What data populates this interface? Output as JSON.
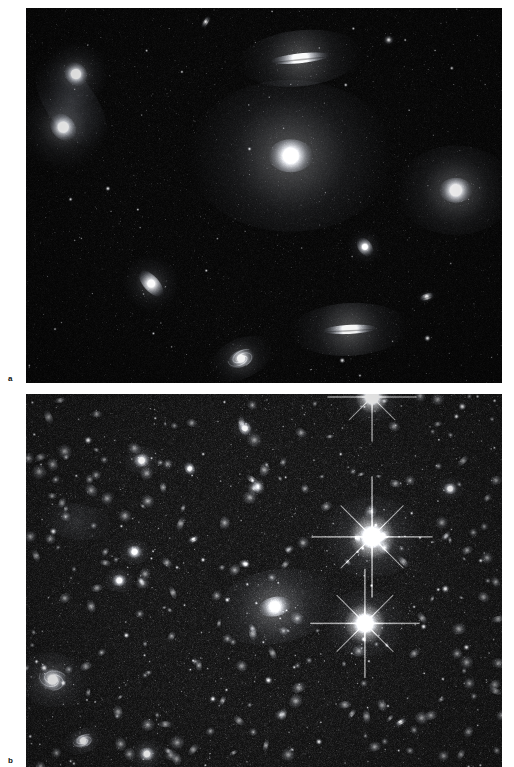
{
  "figure": {
    "background_color": "#ffffff",
    "width": 514,
    "height": 767
  },
  "panels": [
    {
      "id": "panel-a",
      "label": "a",
      "name": "sparse-galaxy-group-field",
      "description": "Wide-field optical image of a sparse galaxy group. A dominant bright elliptical galaxy sits near the centre, with several lenticular and edge-on disc galaxies and an interacting pair showing a tidal tail at upper left.",
      "background_color": "#020202",
      "sky_noise_density": 0.00055,
      "star_count": 430,
      "left": 26,
      "top": 8,
      "width": 476,
      "height": 375,
      "galaxies": [
        {
          "name": "interacting-pair-north",
          "type": "elliptical",
          "cx": 0.105,
          "cy": 0.176,
          "rx": 0.022,
          "ry": 0.034,
          "angle": -38,
          "brightness": 0.96,
          "halo": 2.6
        },
        {
          "name": "interacting-pair-south",
          "type": "disturbed-spiral",
          "cx": 0.078,
          "cy": 0.318,
          "rx": 0.024,
          "ry": 0.04,
          "angle": -40,
          "brightness": 0.92,
          "halo": 2.9
        },
        {
          "name": "tidal-stream",
          "type": "diffuse-stream",
          "cx": 0.095,
          "cy": 0.255,
          "rx": 0.052,
          "ry": 0.135,
          "angle": -36,
          "brightness": 0.22,
          "halo": 1.2
        },
        {
          "name": "edge-on-lenticular-top",
          "type": "edge-on",
          "cx": 0.576,
          "cy": 0.134,
          "rx": 0.062,
          "ry": 0.013,
          "angle": -6,
          "brightness": 0.9,
          "halo": 2.1
        },
        {
          "name": "dominant-elliptical",
          "type": "elliptical",
          "cx": 0.556,
          "cy": 0.394,
          "rx": 0.047,
          "ry": 0.044,
          "angle": 0,
          "brightness": 1.0,
          "halo": 4.6
        },
        {
          "name": "bright-elliptical-east",
          "type": "elliptical",
          "cx": 0.903,
          "cy": 0.486,
          "rx": 0.035,
          "ry": 0.033,
          "angle": 0,
          "brightness": 0.99,
          "halo": 3.6
        },
        {
          "name": "small-spindle-east",
          "type": "edge-on",
          "cx": 0.712,
          "cy": 0.637,
          "rx": 0.014,
          "ry": 0.028,
          "angle": -35,
          "brightness": 0.72,
          "halo": 1.7
        },
        {
          "name": "edge-on-spiral-west",
          "type": "edge-on",
          "cx": 0.263,
          "cy": 0.735,
          "rx": 0.016,
          "ry": 0.043,
          "angle": -42,
          "brightness": 0.8,
          "halo": 1.8
        },
        {
          "name": "tiny-spindle-east",
          "type": "edge-on",
          "cx": 0.842,
          "cy": 0.77,
          "rx": 0.016,
          "ry": 0.008,
          "angle": -18,
          "brightness": 0.6,
          "halo": 1.4
        },
        {
          "name": "edge-on-spiral-south",
          "type": "edge-on",
          "cx": 0.68,
          "cy": 0.857,
          "rx": 0.056,
          "ry": 0.012,
          "angle": -3,
          "brightness": 0.93,
          "halo": 2.2
        },
        {
          "name": "spiral-south-west",
          "type": "spiral",
          "cx": 0.452,
          "cy": 0.935,
          "rx": 0.029,
          "ry": 0.022,
          "angle": -25,
          "brightness": 0.78,
          "halo": 2.4
        },
        {
          "name": "faint-smudge-north",
          "type": "edge-on",
          "cx": 0.378,
          "cy": 0.037,
          "rx": 0.014,
          "ry": 0.006,
          "angle": -58,
          "brightness": 0.5,
          "halo": 1.2
        },
        {
          "name": "faint-smudge-northeast",
          "type": "elliptical",
          "cx": 0.762,
          "cy": 0.085,
          "rx": 0.011,
          "ry": 0.01,
          "angle": 0,
          "brightness": 0.42,
          "halo": 1.5
        }
      ]
    },
    {
      "id": "panel-b",
      "label": "b",
      "name": "rich-galaxy-cluster-field",
      "description": "Deep optical image of a rich galaxy cluster. Hundreds of faint cluster members fill the field, with two very luminous cluster galaxies showing diffraction spikes at right of centre, a diffuse cD-like galaxy at centre, and a face-on spiral at lower left.",
      "background_color": "#050505",
      "sky_noise_density": 0.0062,
      "star_count": 1450,
      "left": 26,
      "top": 394,
      "width": 476,
      "height": 373,
      "galaxies": [
        {
          "name": "bright-spiked-galaxy-upper",
          "type": "spiked",
          "cx": 0.727,
          "cy": 0.383,
          "rx": 0.03,
          "ry": 0.03,
          "angle": 0,
          "brightness": 1.0,
          "halo": 3.6
        },
        {
          "name": "bright-spiked-galaxy-lower",
          "type": "spiked",
          "cx": 0.712,
          "cy": 0.615,
          "rx": 0.027,
          "ry": 0.027,
          "angle": 0,
          "brightness": 0.98,
          "halo": 3.3
        },
        {
          "name": "central-diffuse-cd-galaxy",
          "type": "elliptical",
          "cx": 0.523,
          "cy": 0.57,
          "rx": 0.034,
          "ry": 0.026,
          "angle": -12,
          "brightness": 0.94,
          "halo": 3.8
        },
        {
          "name": "bright-star-top",
          "type": "spiked",
          "cx": 0.727,
          "cy": 0.008,
          "rx": 0.022,
          "ry": 0.022,
          "angle": 0,
          "brightness": 0.97,
          "halo": 3.0
        },
        {
          "name": "face-on-spiral-southwest",
          "type": "spiral",
          "cx": 0.056,
          "cy": 0.766,
          "rx": 0.03,
          "ry": 0.028,
          "angle": 10,
          "brightness": 0.82,
          "halo": 2.6
        },
        {
          "name": "elliptical-member-west",
          "type": "elliptical",
          "cx": 0.243,
          "cy": 0.178,
          "rx": 0.018,
          "ry": 0.017,
          "angle": 0,
          "brightness": 0.86,
          "halo": 2.2
        },
        {
          "name": "elliptical-member-midwest",
          "type": "elliptical",
          "cx": 0.228,
          "cy": 0.423,
          "rx": 0.017,
          "ry": 0.016,
          "angle": 0,
          "brightness": 0.84,
          "halo": 2.1
        },
        {
          "name": "elliptical-member-lowwest",
          "type": "elliptical",
          "cx": 0.196,
          "cy": 0.5,
          "rx": 0.016,
          "ry": 0.015,
          "angle": 0,
          "brightness": 0.86,
          "halo": 2.1
        },
        {
          "name": "elliptical-member-east",
          "type": "elliptical",
          "cx": 0.891,
          "cy": 0.254,
          "rx": 0.015,
          "ry": 0.014,
          "angle": 0,
          "brightness": 0.83,
          "halo": 2.0
        },
        {
          "name": "edge-on-member-north",
          "type": "edge-on",
          "cx": 0.46,
          "cy": 0.092,
          "rx": 0.012,
          "ry": 0.022,
          "angle": -32,
          "brightness": 0.72,
          "halo": 1.6
        },
        {
          "name": "edge-on-member-northwest",
          "type": "edge-on",
          "cx": 0.344,
          "cy": 0.2,
          "rx": 0.01,
          "ry": 0.019,
          "angle": -28,
          "brightness": 0.66,
          "halo": 1.5
        },
        {
          "name": "edge-on-member-centre",
          "type": "edge-on",
          "cx": 0.352,
          "cy": 0.39,
          "rx": 0.012,
          "ry": 0.006,
          "angle": -25,
          "brightness": 0.62,
          "halo": 1.4
        },
        {
          "name": "edge-on-member-southeast",
          "type": "edge-on",
          "cx": 0.787,
          "cy": 0.88,
          "rx": 0.013,
          "ry": 0.006,
          "angle": -30,
          "brightness": 0.64,
          "halo": 1.4
        },
        {
          "name": "diffuse-halo-west",
          "type": "diffuse-stream",
          "cx": 0.105,
          "cy": 0.342,
          "rx": 0.075,
          "ry": 0.048,
          "angle": 8,
          "brightness": 0.16,
          "halo": 1.0
        },
        {
          "name": "spiral-member-south",
          "type": "spiral",
          "cx": 0.12,
          "cy": 0.93,
          "rx": 0.022,
          "ry": 0.016,
          "angle": -20,
          "brightness": 0.74,
          "halo": 2.0
        },
        {
          "name": "elliptical-member-southcentre",
          "type": "elliptical",
          "cx": 0.254,
          "cy": 0.965,
          "rx": 0.018,
          "ry": 0.017,
          "angle": 0,
          "brightness": 0.85,
          "halo": 2.2
        }
      ]
    }
  ]
}
